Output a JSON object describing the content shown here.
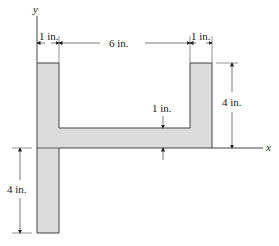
{
  "figure": {
    "fill_color": "#dcdcdc",
    "stroke_color": "#444444",
    "axes": {
      "x_label": "x",
      "y_label": "y"
    },
    "dimensions": {
      "left_flange_width": "1 in.",
      "web_span": "6 in.",
      "right_flange_width": "1 in.",
      "web_thickness": "1 in.",
      "right_height_above_axis": "4 in.",
      "left_depth_below_axis": "4 in."
    }
  }
}
